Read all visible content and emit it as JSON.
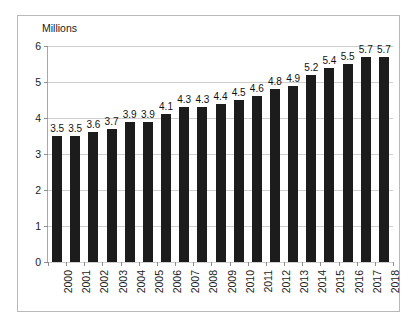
{
  "chart_data": {
    "type": "bar",
    "title": "",
    "axis_note": "Millions",
    "xlabel": "",
    "ylabel": "Millions",
    "ylim": [
      0,
      6
    ],
    "yticks": [
      0,
      1,
      2,
      3,
      4,
      5,
      6
    ],
    "ytick_labels": [
      "0",
      "1",
      "2",
      "3",
      "4",
      "5",
      "6"
    ],
    "grid": true,
    "legend": null,
    "bar_color": "#1c1c1c",
    "grid_color": "#cfcfcf",
    "axis_color": "#a8a8a8",
    "border_color": "#b9b9b9",
    "categories": [
      "2000",
      "2001",
      "2002",
      "2003",
      "2004",
      "2005",
      "2006",
      "2007",
      "2008",
      "2009",
      "2010",
      "2011",
      "2012",
      "2013",
      "2014",
      "2015",
      "2016",
      "2017",
      "2018"
    ],
    "values": [
      3.5,
      3.5,
      3.6,
      3.7,
      3.9,
      3.9,
      4.1,
      4.3,
      4.3,
      4.4,
      4.5,
      4.6,
      4.8,
      4.9,
      5.2,
      5.4,
      5.5,
      5.7,
      5.7
    ],
    "value_labels": [
      "3.5",
      "3.5",
      "3.6",
      "3.7",
      "3.9",
      "3.9",
      "4.1",
      "4.3",
      "4.3",
      "4.4",
      "4.5",
      "4.6",
      "4.8",
      "4.9",
      "5.2",
      "5.4",
      "5.5",
      "5.7",
      "5.7"
    ]
  }
}
